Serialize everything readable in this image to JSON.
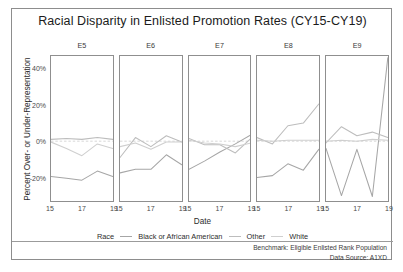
{
  "chart": {
    "title": "Racial Disparity in Enlisted Promotion Rates (CY15-CY19)",
    "xlabel": "Date",
    "ylabel": "Percent Over- or Under-Representation",
    "legend_title": "Race",
    "footer_line1": "Benchmark: Eligible Enlisted Rank Population",
    "footer_line2": "Data Source: A1XD"
  },
  "chart_data": {
    "type": "line",
    "title": "Racial Disparity in Enlisted Promotion Rates (CY15-CY19)",
    "xlabel": "Date",
    "ylabel": "Percent Over- or Under-Representation",
    "x": [
      15,
      16,
      17,
      18,
      19
    ],
    "xticks": [
      "15",
      "17",
      "19"
    ],
    "xtick_values": [
      15,
      17,
      19
    ],
    "yticks": [
      "40%",
      "20%",
      "0%",
      "-20%"
    ],
    "ytick_values": [
      40,
      20,
      0,
      -20
    ],
    "ylim": [
      -33,
      47
    ],
    "xlim": [
      15,
      19
    ],
    "grid": false,
    "zero_reference_line": true,
    "legend_position": "bottom",
    "legend_title": "Race",
    "facet_variable": "Enlisted Rank",
    "facets": [
      "E5",
      "E6",
      "E7",
      "E8",
      "E9"
    ],
    "series": [
      {
        "name": "Black or African American",
        "color": "#a6a6a6",
        "panels": {
          "E5": [
            -19.5,
            -20.5,
            -21.5,
            -16.5,
            -19.5
          ],
          "E6": [
            -17.5,
            -15.5,
            -15.5,
            -7.5,
            -13.0
          ],
          "E7": [
            -15.5,
            -11.0,
            -6.0,
            -1.5,
            3.5
          ],
          "E8": [
            -20.0,
            -19.0,
            -12.5,
            -16.0,
            -4.5
          ],
          "E9": [
            -4.0,
            -30.0,
            -4.5,
            -30.5,
            46.0
          ]
        }
      },
      {
        "name": "Other",
        "color": "#bdbdbd",
        "panels": {
          "E5": [
            1.0,
            1.5,
            1.0,
            2.0,
            1.0
          ],
          "E6": [
            -9.0,
            2.0,
            -3.0,
            3.0,
            -0.5
          ],
          "E7": [
            1.5,
            -2.0,
            -2.0,
            -6.5,
            1.5
          ],
          "E8": [
            2.0,
            -1.5,
            8.5,
            10.0,
            20.5
          ],
          "E9": [
            -1.0,
            8.0,
            3.0,
            5.0,
            2.0
          ]
        }
      },
      {
        "name": "White",
        "color": "#cfcfcf",
        "panels": {
          "E5": [
            -0.5,
            -4.0,
            -8.0,
            -1.5,
            -4.0
          ],
          "E6": [
            -3.0,
            -1.0,
            -4.5,
            -0.5,
            -0.5
          ],
          "E7": [
            0.5,
            -1.0,
            -1.5,
            -3.0,
            -1.0
          ],
          "E8": [
            0.5,
            0.0,
            0.5,
            0.5,
            0.5
          ],
          "E9": [
            0.0,
            0.5,
            0.0,
            1.0,
            0.5
          ]
        }
      }
    ]
  },
  "legend": {
    "items": [
      {
        "label": "Black or African American"
      },
      {
        "label": "Other"
      },
      {
        "label": "White"
      }
    ]
  }
}
